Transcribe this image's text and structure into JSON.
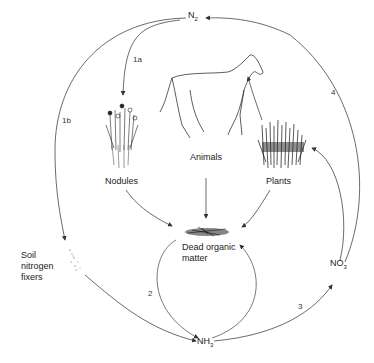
{
  "diagram": {
    "nodes": {
      "n2": {
        "label": "N",
        "sub": "2"
      },
      "nh3": {
        "label": "NH",
        "sub": "3"
      },
      "no3": {
        "label": "NO",
        "sub": "3"
      },
      "nodules": {
        "label": "Nodules"
      },
      "animals": {
        "label": "Animals"
      },
      "plants": {
        "label": "Plants"
      },
      "dead_matter": {
        "line1": "Dead organic",
        "line2": "matter"
      },
      "soil_fixers": {
        "line1": "Soil",
        "line2": "nitrogen",
        "line3": "fixers"
      }
    },
    "arrow_labels": {
      "a1a": "1a",
      "a1b": "1b",
      "a2": "2",
      "a3": "3",
      "a4": "4"
    },
    "icons": [
      "horse-illustration",
      "nodule-plant-illustration",
      "grass-plants-illustration",
      "dead-organic-matter-illustration",
      "soil-bacteria-illustration"
    ]
  }
}
